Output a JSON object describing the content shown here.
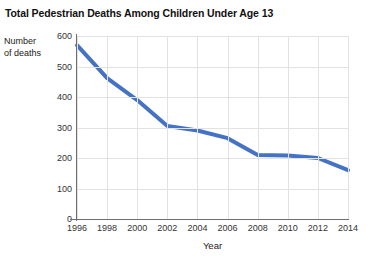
{
  "chart_data": {
    "type": "line",
    "title": "Total Pedestrian Deaths Among Children Under Age 13",
    "xlabel": "Year",
    "ylabel": "Number of deaths",
    "ylabel_lines": [
      "Number",
      "of deaths"
    ],
    "x": [
      1996,
      1998,
      2000,
      2002,
      2004,
      2006,
      2008,
      2010,
      2012,
      2014
    ],
    "values": [
      570,
      462,
      390,
      305,
      290,
      265,
      210,
      208,
      200,
      160
    ],
    "series": [
      {
        "name": "Pedestrian deaths",
        "values": [
          570,
          462,
          390,
          305,
          290,
          265,
          210,
          208,
          200,
          160
        ]
      }
    ],
    "xtick_labels": [
      "1996",
      "1998",
      "2000",
      "2002",
      "2004",
      "2006",
      "2008",
      "2010",
      "2012",
      "2014"
    ],
    "ytick_labels": [
      "0",
      "100",
      "200",
      "300",
      "400",
      "500",
      "600"
    ],
    "ytick_values": [
      0,
      100,
      200,
      300,
      400,
      500,
      600
    ],
    "ylim": [
      0,
      600
    ],
    "xlim": [
      1996,
      2014
    ],
    "grid": true,
    "legend": "none",
    "line_color": "#4472c4",
    "grid_color": "#e2e2e2",
    "axis_color": "#6f6f6f"
  }
}
